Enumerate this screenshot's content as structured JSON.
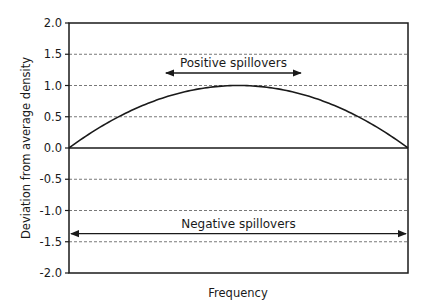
{
  "chart_data": {
    "type": "line",
    "title": "",
    "xlabel": "Frequency",
    "ylabel": "Deviation from average density",
    "ylim": [
      -2.0,
      2.0
    ],
    "xlim": [
      0,
      1
    ],
    "yticks": [
      2.0,
      1.5,
      1.0,
      0.5,
      0.0,
      -0.5,
      -1.0,
      -1.5,
      -2.0
    ],
    "ytick_labels": [
      "2.0",
      "1.5",
      "1.0",
      "0.5",
      "0.0",
      "-0.5",
      "-1.0",
      "-1.5",
      "-2.0"
    ],
    "xticks": [],
    "grid": {
      "y": true,
      "style": "dashed",
      "zero_line": "solid"
    },
    "legend": null,
    "series": [
      {
        "name": "deviation curve",
        "x": [
          0.0,
          0.1,
          0.2,
          0.3,
          0.4,
          0.5,
          0.6,
          0.7,
          0.8,
          0.9,
          1.0
        ],
        "values": [
          0.0,
          0.36,
          0.64,
          0.84,
          0.96,
          1.0,
          0.96,
          0.84,
          0.64,
          0.36,
          0.0
        ]
      }
    ],
    "annotations": [
      {
        "text": "Positive spillovers",
        "type": "double-arrow",
        "x_range": [
          0.28,
          0.69
        ],
        "y": 1.2
      },
      {
        "text": "Negative spillovers",
        "type": "double-arrow",
        "x_range": [
          0.0,
          1.0
        ],
        "y": -1.37
      }
    ],
    "colors": {
      "line": "#1a1a1a",
      "grid": "#555555",
      "axis": "#1a1a1a"
    }
  }
}
